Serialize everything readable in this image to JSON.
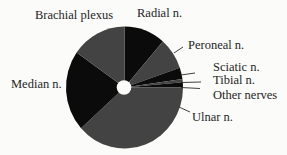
{
  "chart_data": {
    "type": "pie",
    "title": "",
    "style": "donut with small center hole, alternating black and dark-gray slices, start at 12 o'clock, clockwise",
    "legend": "none (direct labels)",
    "slices": [
      {
        "label": "Radial n.",
        "value": 11.4,
        "start_deg": 0,
        "end_deg": 41,
        "color": "#0b0b0b"
      },
      {
        "label": "Peroneal n.",
        "value": 8.3,
        "start_deg": 41,
        "end_deg": 71,
        "color": "#434343"
      },
      {
        "label": "Sciatic n.",
        "value": 3.1,
        "start_deg": 71,
        "end_deg": 82,
        "color": "#0b0b0b"
      },
      {
        "label": "Tibial n.",
        "value": 0.8,
        "start_deg": 82,
        "end_deg": 85,
        "color": "#434343"
      },
      {
        "label": "Other nerves",
        "value": 1.4,
        "start_deg": 85,
        "end_deg": 90,
        "color": "#0b0b0b"
      },
      {
        "label": "Ulnar n.",
        "value": 38.3,
        "start_deg": 90,
        "end_deg": 228,
        "color": "#434343"
      },
      {
        "label": "Median n.",
        "value": 21.4,
        "start_deg": 228,
        "end_deg": 305,
        "color": "#0b0b0b"
      },
      {
        "label": "Brachial plexus",
        "value": 15.3,
        "start_deg": 305,
        "end_deg": 360,
        "color": "#434343"
      }
    ],
    "categories": [
      "Radial n.",
      "Peroneal n.",
      "Sciatic n.",
      "Tibial n.",
      "Other nerves",
      "Ulnar n.",
      "Median n.",
      "Brachial plexus"
    ],
    "values": [
      11.4,
      8.3,
      3.1,
      0.8,
      1.4,
      38.3,
      21.4,
      15.3
    ],
    "units": "approximate percent of total (no numeric labels shown)"
  },
  "labels": {
    "brachial": "Brachial plexus",
    "radial": "Radial n.",
    "peroneal": "Peroneal n.",
    "sciatic": "Sciatic n.",
    "tibial": "Tibial n.",
    "other": "Other nerves",
    "ulnar": "Ulnar n.",
    "median": "Median n."
  }
}
